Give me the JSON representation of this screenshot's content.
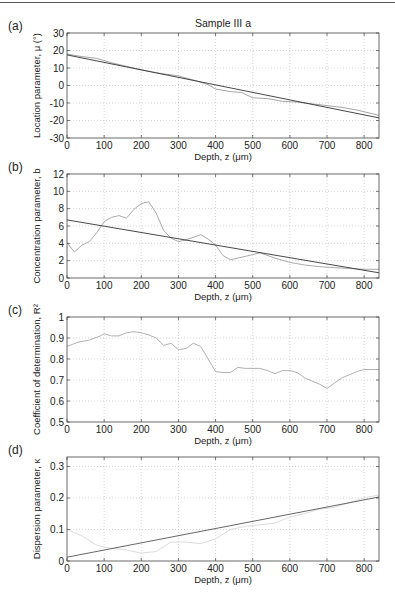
{
  "page": {
    "header_fragment": "Computer Aided Biomedical Microscopy"
  },
  "chart_data": [
    {
      "panel": "(a)",
      "type": "line",
      "title": "Sample III a",
      "xlabel": "Depth, z (μm)",
      "ylabel": "Location parameter, μ (°)",
      "xlim": [
        0,
        840
      ],
      "ylim": [
        -30,
        30
      ],
      "xticks": [
        0,
        100,
        200,
        300,
        400,
        500,
        600,
        700,
        800
      ],
      "yticks": [
        -30,
        -20,
        -10,
        0,
        10,
        20,
        30
      ],
      "grid": true,
      "box": {
        "left": 67,
        "top": 33,
        "right": 379,
        "bottom": 138
      },
      "series": [
        {
          "name": "measured",
          "color": "#9a9a9a",
          "x": [
            0,
            40,
            80,
            120,
            160,
            200,
            250,
            300,
            350,
            380,
            400,
            440,
            470,
            500,
            540,
            580,
            620,
            660,
            700,
            740,
            780,
            840
          ],
          "y": [
            18,
            16.5,
            15.5,
            13,
            11,
            9,
            7,
            5.5,
            2.5,
            0.5,
            -2,
            -3.5,
            -4,
            -7,
            -7.5,
            -9,
            -9.5,
            -10.5,
            -11.5,
            -12.5,
            -14,
            -17
          ]
        },
        {
          "name": "linear fit",
          "color": "#333333",
          "x": [
            0,
            840
          ],
          "y": [
            17.5,
            -18.5
          ]
        }
      ]
    },
    {
      "panel": "(b)",
      "type": "line",
      "title": "",
      "xlabel": "Depth, z (μm)",
      "ylabel": "Concentration parameter, b",
      "xlim": [
        0,
        840
      ],
      "ylim": [
        0,
        12
      ],
      "xticks": [
        0,
        100,
        200,
        300,
        400,
        500,
        600,
        700,
        800
      ],
      "yticks": [
        0,
        2,
        4,
        6,
        8,
        10,
        12
      ],
      "grid": true,
      "box": {
        "left": 67,
        "top": 174,
        "right": 379,
        "bottom": 278
      },
      "series": [
        {
          "name": "measured",
          "color": "#a0a0a0",
          "x": [
            0,
            20,
            40,
            60,
            80,
            100,
            120,
            140,
            160,
            180,
            200,
            220,
            240,
            260,
            280,
            300,
            320,
            340,
            360,
            380,
            400,
            420,
            440,
            460,
            500,
            520,
            560,
            600,
            640,
            680,
            720,
            760,
            800,
            840
          ],
          "y": [
            4.1,
            3.0,
            3.8,
            4.2,
            5.2,
            6.5,
            7.0,
            7.2,
            6.9,
            7.9,
            8.6,
            8.8,
            7.5,
            5.5,
            4.6,
            4.2,
            4.4,
            4.7,
            5.0,
            4.5,
            3.8,
            2.6,
            2.1,
            2.3,
            2.7,
            2.9,
            2.3,
            1.8,
            1.5,
            1.3,
            1.2,
            1.1,
            1.0,
            1.0
          ]
        },
        {
          "name": "linear fit",
          "color": "#333333",
          "x": [
            0,
            840
          ],
          "y": [
            6.7,
            0.6
          ]
        }
      ]
    },
    {
      "panel": "(c)",
      "type": "line",
      "title": "",
      "xlabel": "Depth, z (μm)",
      "ylabel": "Coefficient of determination, R²",
      "xlim": [
        0,
        840
      ],
      "ylim": [
        0.5,
        1
      ],
      "xticks": [
        0,
        100,
        200,
        300,
        400,
        500,
        600,
        700,
        800
      ],
      "yticks": [
        0.5,
        0.6,
        0.7,
        0.8,
        0.9,
        1
      ],
      "grid": true,
      "box": {
        "left": 67,
        "top": 317,
        "right": 379,
        "bottom": 422
      },
      "series": [
        {
          "name": "R2",
          "color": "#a8a8a8",
          "x": [
            0,
            30,
            60,
            90,
            100,
            120,
            140,
            160,
            180,
            200,
            220,
            240,
            260,
            280,
            300,
            320,
            340,
            360,
            380,
            400,
            420,
            440,
            460,
            480,
            500,
            520,
            540,
            560,
            580,
            600,
            620,
            640,
            660,
            680,
            700,
            720,
            740,
            760,
            780,
            800,
            840
          ],
          "y": [
            0.86,
            0.88,
            0.89,
            0.91,
            0.92,
            0.91,
            0.91,
            0.925,
            0.93,
            0.925,
            0.915,
            0.9,
            0.865,
            0.875,
            0.845,
            0.85,
            0.875,
            0.86,
            0.8,
            0.74,
            0.735,
            0.735,
            0.76,
            0.755,
            0.755,
            0.755,
            0.745,
            0.73,
            0.745,
            0.745,
            0.735,
            0.71,
            0.695,
            0.68,
            0.66,
            0.685,
            0.71,
            0.725,
            0.74,
            0.75,
            0.75
          ]
        }
      ]
    },
    {
      "panel": "(d)",
      "type": "line",
      "title": "",
      "xlabel": "Depth, z (μm)",
      "ylabel": "Dispersion parameter, κ",
      "xlim": [
        0,
        840
      ],
      "ylim": [
        0,
        0.33
      ],
      "xticks": [
        0,
        100,
        200,
        300,
        400,
        500,
        600,
        700,
        800
      ],
      "yticks": [
        0,
        0.1,
        0.2,
        0.3
      ],
      "grid": true,
      "box": {
        "left": 67,
        "top": 457,
        "right": 379,
        "bottom": 561
      },
      "series": [
        {
          "name": "measured",
          "color": "#d8d8d8",
          "x": [
            0,
            40,
            80,
            120,
            160,
            200,
            240,
            280,
            320,
            360,
            400,
            440,
            480,
            520,
            560,
            600,
            640,
            680,
            720,
            760,
            800,
            840
          ],
          "y": [
            0.1,
            0.08,
            0.05,
            0.04,
            0.035,
            0.025,
            0.03,
            0.06,
            0.06,
            0.055,
            0.07,
            0.1,
            0.11,
            0.115,
            0.12,
            0.14,
            0.15,
            0.165,
            0.17,
            0.185,
            0.2,
            0.21
          ]
        },
        {
          "name": "linear fit",
          "color": "#555555",
          "x": [
            0,
            840
          ],
          "y": [
            0.012,
            0.203
          ]
        }
      ]
    }
  ]
}
